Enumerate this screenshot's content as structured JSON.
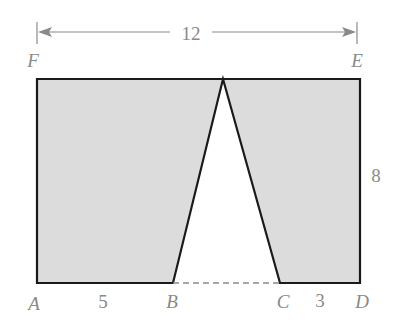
{
  "diagram": {
    "type": "geometry-figure",
    "colors": {
      "fill": "#dcdcdc",
      "stroke": "#1a1a1a",
      "label": "#8a8a8a",
      "dimension_line": "#8a8a8a"
    },
    "points": {
      "A": "A",
      "B": "B",
      "C": "C",
      "D": "D",
      "E": "E",
      "F": "F"
    },
    "dimensions": {
      "width_FE": "12",
      "height_ED": "8",
      "segment_AB": "5",
      "segment_CD": "3"
    }
  }
}
